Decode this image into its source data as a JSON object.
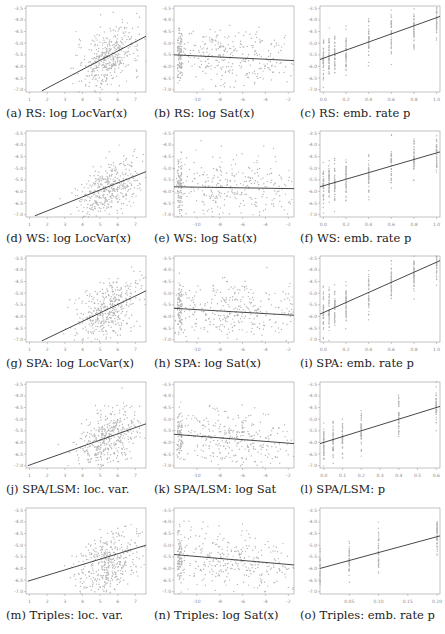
{
  "chart_data": [
    {
      "id": "a",
      "type": "scatter",
      "caption": "(a) RS: log LocVar(x)",
      "method": "RS",
      "feature": "log LocVar(x)",
      "xticks": [
        "1",
        "2",
        "3",
        "4",
        "5",
        "6",
        "7"
      ],
      "xlim": [
        0.8,
        7.6
      ],
      "yticks": [
        "-3.5",
        "-4.0",
        "-4.5",
        "-5.0",
        "-5.5",
        "-6.0",
        "-6.5",
        "-7.0"
      ],
      "ylim": [
        -7.1,
        -3.4
      ],
      "fit_line": {
        "x": [
          1.7,
          7.6
        ],
        "y": [
          -7.05,
          -4.7
        ]
      },
      "cloud_center": [
        5.5,
        -5.6
      ],
      "cloud_spread": [
        0.9,
        0.6
      ]
    },
    {
      "id": "b",
      "type": "scatter",
      "caption": "(b) RS: log Sat(x)",
      "method": "RS",
      "feature": "log Sat(x)",
      "xticks": [
        "-10",
        "-8",
        "-6",
        "-4",
        "-2"
      ],
      "xlim": [
        -12,
        -1.5
      ],
      "yticks": [
        "-3.5",
        "-4.0",
        "-4.5",
        "-5.0",
        "-5.5",
        "-6.0",
        "-6.5",
        "-7.0"
      ],
      "ylim": [
        -7.1,
        -3.4
      ],
      "fit_line": {
        "x": [
          -12,
          -1.5
        ],
        "y": [
          -5.5,
          -5.75
        ]
      },
      "cloud_center": [
        -7,
        -5.6
      ],
      "cloud_spread": [
        3,
        0.6
      ]
    },
    {
      "id": "c",
      "type": "scatter",
      "caption": "(c) RS: emb. rate p",
      "method": "RS",
      "feature": "emb. rate p",
      "xticks": [
        "0.0",
        "0.2",
        "0.4",
        "0.6",
        "0.8",
        "1.0"
      ],
      "xlim": [
        -0.03,
        1.03
      ],
      "yticks": [
        "-3.5",
        "-4.0",
        "-4.5",
        "-5.0",
        "-5.5",
        "-6.0",
        "-6.5",
        "-7.0"
      ],
      "ylim": [
        -7.1,
        -3.4
      ],
      "fit_line": {
        "x": [
          -0.03,
          1.03
        ],
        "y": [
          -5.7,
          -3.85
        ]
      },
      "stripes": [
        0.0,
        0.05,
        0.1,
        0.2,
        0.4,
        0.6,
        0.8,
        1.0
      ]
    },
    {
      "id": "d",
      "type": "scatter",
      "caption": "(d) WS: log LocVar(x)",
      "method": "WS",
      "feature": "log LocVar(x)",
      "xticks": [
        "1",
        "2",
        "3",
        "4",
        "5",
        "6",
        "7"
      ],
      "xlim": [
        0.8,
        7.6
      ],
      "yticks": [
        "-3.5",
        "-4.0",
        "-4.5",
        "-5.0",
        "-5.5",
        "-6.0",
        "-6.5",
        "-7.0"
      ],
      "ylim": [
        -7.1,
        -3.4
      ],
      "fit_line": {
        "x": [
          1.3,
          7.6
        ],
        "y": [
          -7.05,
          -5.15
        ]
      },
      "cloud_center": [
        5.5,
        -5.9
      ],
      "cloud_spread": [
        0.9,
        0.6
      ]
    },
    {
      "id": "e",
      "type": "scatter",
      "caption": "(e) WS: log Sat(x)",
      "method": "WS",
      "feature": "log Sat(x)",
      "xticks": [
        "-10",
        "-8",
        "-6",
        "-4",
        "-2"
      ],
      "xlim": [
        -12,
        -1.5
      ],
      "yticks": [
        "-3.5",
        "-4.0",
        "-4.5",
        "-5.0",
        "-5.5",
        "-6.0",
        "-6.5",
        "-7.0"
      ],
      "ylim": [
        -7.1,
        -3.4
      ],
      "fit_line": {
        "x": [
          -12,
          -1.5
        ],
        "y": [
          -5.8,
          -5.88
        ]
      },
      "cloud_center": [
        -7,
        -5.8
      ],
      "cloud_spread": [
        3,
        0.6
      ]
    },
    {
      "id": "f",
      "type": "scatter",
      "caption": "(f) WS: emb. rate p",
      "method": "WS",
      "feature": "emb. rate p",
      "xticks": [
        "0.0",
        "0.2",
        "0.4",
        "0.6",
        "0.8",
        "1.0"
      ],
      "xlim": [
        -0.03,
        1.03
      ],
      "yticks": [
        "-3.5",
        "-4.0",
        "-4.5",
        "-5.0",
        "-5.5",
        "-6.0",
        "-6.5",
        "-7.0"
      ],
      "ylim": [
        -7.1,
        -3.4
      ],
      "fit_line": {
        "x": [
          -0.03,
          1.03
        ],
        "y": [
          -5.8,
          -4.3
        ]
      },
      "stripes": [
        0.0,
        0.05,
        0.1,
        0.2,
        0.4,
        0.6,
        0.8,
        1.0
      ]
    },
    {
      "id": "g",
      "type": "scatter",
      "caption": "(g) SPA: log LocVar(x)",
      "method": "SPA",
      "feature": "log LocVar(x)",
      "xticks": [
        "1",
        "2",
        "3",
        "4",
        "5",
        "6",
        "7"
      ],
      "xlim": [
        0.8,
        7.6
      ],
      "yticks": [
        "-3.5",
        "-4.0",
        "-4.5",
        "-5.0",
        "-5.5",
        "-6.0",
        "-6.5",
        "-7.0"
      ],
      "ylim": [
        -7.1,
        -3.4
      ],
      "fit_line": {
        "x": [
          1.7,
          7.6
        ],
        "y": [
          -7.05,
          -4.9
        ]
      },
      "cloud_center": [
        5.5,
        -5.7
      ],
      "cloud_spread": [
        0.9,
        0.6
      ]
    },
    {
      "id": "h",
      "type": "scatter",
      "caption": "(h) SPA: log Sat(x)",
      "method": "SPA",
      "feature": "log Sat(x)",
      "xticks": [
        "-10",
        "-8",
        "-6",
        "-4",
        "-2"
      ],
      "xlim": [
        -12,
        -1.5
      ],
      "yticks": [
        "-3.5",
        "-4.0",
        "-4.5",
        "-5.0",
        "-5.5",
        "-6.0",
        "-6.5",
        "-7.0"
      ],
      "ylim": [
        -7.1,
        -3.4
      ],
      "fit_line": {
        "x": [
          -12,
          -1.5
        ],
        "y": [
          -5.65,
          -5.95
        ]
      },
      "cloud_center": [
        -7,
        -5.7
      ],
      "cloud_spread": [
        3,
        0.6
      ]
    },
    {
      "id": "i",
      "type": "scatter",
      "caption": "(i) SPA: emb. rate p",
      "method": "SPA",
      "feature": "emb. rate p",
      "xticks": [
        "0.0",
        "0.2",
        "0.4",
        "0.6",
        "0.8",
        "1.0"
      ],
      "xlim": [
        -0.03,
        1.03
      ],
      "yticks": [
        "-3.5",
        "-4.0",
        "-4.5",
        "-5.0",
        "-5.5",
        "-6.0",
        "-6.5",
        "-7.0"
      ],
      "ylim": [
        -7.1,
        -3.4
      ],
      "fit_line": {
        "x": [
          -0.03,
          1.03
        ],
        "y": [
          -5.9,
          -3.6
        ]
      },
      "stripes": [
        0.0,
        0.05,
        0.1,
        0.2,
        0.4,
        0.6,
        0.8,
        1.0
      ]
    },
    {
      "id": "j",
      "type": "scatter",
      "caption": "(j) SPA/LSM: loc. var.",
      "method": "SPA/LSM",
      "feature": "loc. var.",
      "xticks": [
        "1",
        "2",
        "3",
        "4",
        "5",
        "6",
        "7"
      ],
      "xlim": [
        0.8,
        7.6
      ],
      "yticks": [
        "-3.5",
        "-4.0",
        "-4.5",
        "-5.0",
        "-5.5",
        "-6.0",
        "-6.5",
        "-7.0"
      ],
      "ylim": [
        -7.1,
        -3.4
      ],
      "fit_line": {
        "x": [
          0.9,
          7.6
        ],
        "y": [
          -7.0,
          -5.2
        ]
      },
      "cloud_center": [
        5.5,
        -5.8
      ],
      "cloud_spread": [
        0.9,
        0.6
      ]
    },
    {
      "id": "k",
      "type": "scatter",
      "caption": "(k) SPA/LSM: log Sat",
      "method": "SPA/LSM",
      "feature": "log Sat",
      "xticks": [
        "-10",
        "-8",
        "-6",
        "-4",
        "-2"
      ],
      "xlim": [
        -12,
        -1.5
      ],
      "yticks": [
        "-3.5",
        "-4.0",
        "-4.5",
        "-5.0",
        "-5.5",
        "-6.0",
        "-6.5",
        "-7.0"
      ],
      "ylim": [
        -7.1,
        -3.4
      ],
      "fit_line": {
        "x": [
          -12,
          -1.5
        ],
        "y": [
          -5.65,
          -6.05
        ]
      },
      "cloud_center": [
        -7,
        -5.8
      ],
      "cloud_spread": [
        3,
        0.6
      ]
    },
    {
      "id": "l",
      "type": "scatter",
      "caption": "(l) SPA/LSM: p",
      "method": "SPA/LSM",
      "feature": "p",
      "xticks": [
        "0.0",
        "0.1",
        "0.2",
        "0.3",
        "0.4",
        "0.5",
        "0.6"
      ],
      "xlim": [
        -0.02,
        0.62
      ],
      "yticks": [
        "-3.5",
        "-4.0",
        "-4.5",
        "-5.0",
        "-5.5",
        "-6.0",
        "-6.5",
        "-7.0"
      ],
      "ylim": [
        -7.1,
        -3.4
      ],
      "fit_line": {
        "x": [
          -0.02,
          0.62
        ],
        "y": [
          -6.05,
          -4.45
        ]
      },
      "stripes": [
        0.0,
        0.05,
        0.1,
        0.2,
        0.4,
        0.6
      ]
    },
    {
      "id": "m",
      "type": "scatter",
      "caption": "(m) Triples: loc. var.",
      "method": "Triples",
      "feature": "loc. var.",
      "xticks": [
        "1",
        "2",
        "3",
        "4",
        "5",
        "6",
        "7"
      ],
      "xlim": [
        0.8,
        7.6
      ],
      "yticks": [
        "-3.5",
        "-4.0",
        "-4.5",
        "-5.0",
        "-5.5",
        "-6.0",
        "-6.5",
        "-7.0"
      ],
      "ylim": [
        -7.1,
        -3.4
      ],
      "fit_line": {
        "x": [
          0.9,
          7.6
        ],
        "y": [
          -6.55,
          -5.0
        ]
      },
      "cloud_center": [
        5.5,
        -5.8
      ],
      "cloud_spread": [
        0.9,
        0.6
      ]
    },
    {
      "id": "n",
      "type": "scatter",
      "caption": "(n) Triples: log Sat(x)",
      "method": "Triples",
      "feature": "log Sat(x)",
      "xticks": [
        "-10",
        "-8",
        "-6",
        "-4",
        "-2"
      ],
      "xlim": [
        -12,
        -1.5
      ],
      "yticks": [
        "-3.5",
        "-4.0",
        "-4.5",
        "-5.0",
        "-5.5",
        "-6.0",
        "-6.5",
        "-7.0"
      ],
      "ylim": [
        -7.1,
        -3.4
      ],
      "fit_line": {
        "x": [
          -12,
          -1.5
        ],
        "y": [
          -5.4,
          -5.85
        ]
      },
      "cloud_center": [
        -7,
        -5.6
      ],
      "cloud_spread": [
        3,
        0.6
      ]
    },
    {
      "id": "o",
      "type": "scatter",
      "caption": "(o) Triples: emb. rate p",
      "method": "Triples",
      "feature": "emb. rate p",
      "xticks": [
        "0.05",
        "0.10",
        "0.15",
        "0.20"
      ],
      "xlim": [
        0.0,
        0.205
      ],
      "yticks": [
        "-3.5",
        "-4.0",
        "-4.5",
        "-5.0",
        "-5.5",
        "-6.0",
        "-6.5",
        "-7.0"
      ],
      "ylim": [
        -7.1,
        -3.4
      ],
      "fit_line": {
        "x": [
          0.0,
          0.205
        ],
        "y": [
          -6.0,
          -4.6
        ]
      },
      "stripes": [
        0.0,
        0.05,
        0.1,
        0.2
      ]
    }
  ]
}
